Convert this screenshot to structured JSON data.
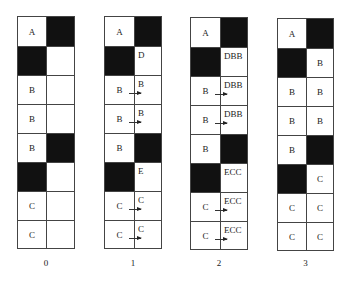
{
  "diagram": {
    "colors": {
      "filled": "#111111",
      "empty": "#ffffff",
      "line": "#444444"
    },
    "columns": [
      {
        "label": "0",
        "rows": [
          {
            "left": {
              "fill": false,
              "text": "A"
            },
            "right": {
              "fill": true,
              "text": ""
            },
            "arrow": false
          },
          {
            "left": {
              "fill": true,
              "text": ""
            },
            "right": {
              "fill": false,
              "text": ""
            },
            "arrow": false
          },
          {
            "left": {
              "fill": false,
              "text": "B"
            },
            "right": {
              "fill": false,
              "text": ""
            },
            "arrow": false
          },
          {
            "left": {
              "fill": false,
              "text": "B"
            },
            "right": {
              "fill": false,
              "text": ""
            },
            "arrow": false
          },
          {
            "left": {
              "fill": false,
              "text": "B"
            },
            "right": {
              "fill": true,
              "text": ""
            },
            "arrow": false
          },
          {
            "left": {
              "fill": true,
              "text": ""
            },
            "right": {
              "fill": false,
              "text": ""
            },
            "arrow": false
          },
          {
            "left": {
              "fill": false,
              "text": "C"
            },
            "right": {
              "fill": false,
              "text": ""
            },
            "arrow": false
          },
          {
            "left": {
              "fill": false,
              "text": "C"
            },
            "right": {
              "fill": false,
              "text": ""
            },
            "arrow": false
          }
        ]
      },
      {
        "label": "1",
        "rows": [
          {
            "left": {
              "fill": false,
              "text": "A"
            },
            "right": {
              "fill": true,
              "text": ""
            },
            "arrow": false
          },
          {
            "left": {
              "fill": true,
              "text": ""
            },
            "right": {
              "fill": false,
              "text": "D"
            },
            "arrow": false
          },
          {
            "left": {
              "fill": false,
              "text": "B"
            },
            "right": {
              "fill": false,
              "text": "B"
            },
            "arrow": true
          },
          {
            "left": {
              "fill": false,
              "text": "B"
            },
            "right": {
              "fill": false,
              "text": "B"
            },
            "arrow": true
          },
          {
            "left": {
              "fill": false,
              "text": "B"
            },
            "right": {
              "fill": true,
              "text": ""
            },
            "arrow": false
          },
          {
            "left": {
              "fill": true,
              "text": ""
            },
            "right": {
              "fill": false,
              "text": "E"
            },
            "arrow": false
          },
          {
            "left": {
              "fill": false,
              "text": "C"
            },
            "right": {
              "fill": false,
              "text": "C"
            },
            "arrow": true
          },
          {
            "left": {
              "fill": false,
              "text": "C"
            },
            "right": {
              "fill": false,
              "text": "C"
            },
            "arrow": true
          }
        ]
      },
      {
        "label": "2",
        "rows": [
          {
            "left": {
              "fill": false,
              "text": "A"
            },
            "right": {
              "fill": true,
              "text": ""
            },
            "arrow": false
          },
          {
            "left": {
              "fill": true,
              "text": ""
            },
            "right": {
              "fill": false,
              "text": "DBB"
            },
            "arrow": false
          },
          {
            "left": {
              "fill": false,
              "text": "B"
            },
            "right": {
              "fill": false,
              "text": "DBB"
            },
            "arrow": true
          },
          {
            "left": {
              "fill": false,
              "text": "B"
            },
            "right": {
              "fill": false,
              "text": "DBB"
            },
            "arrow": true
          },
          {
            "left": {
              "fill": false,
              "text": "B"
            },
            "right": {
              "fill": true,
              "text": ""
            },
            "arrow": false
          },
          {
            "left": {
              "fill": true,
              "text": ""
            },
            "right": {
              "fill": false,
              "text": "ECC"
            },
            "arrow": false
          },
          {
            "left": {
              "fill": false,
              "text": "C"
            },
            "right": {
              "fill": false,
              "text": "ECC"
            },
            "arrow": true
          },
          {
            "left": {
              "fill": false,
              "text": "C"
            },
            "right": {
              "fill": false,
              "text": "ECC"
            },
            "arrow": true
          }
        ]
      },
      {
        "label": "3",
        "rows": [
          {
            "left": {
              "fill": false,
              "text": "A"
            },
            "right": {
              "fill": true,
              "text": ""
            },
            "arrow": false
          },
          {
            "left": {
              "fill": true,
              "text": ""
            },
            "right": {
              "fill": false,
              "text": "B"
            },
            "arrow": false
          },
          {
            "left": {
              "fill": false,
              "text": "B"
            },
            "right": {
              "fill": false,
              "text": "B"
            },
            "arrow": false
          },
          {
            "left": {
              "fill": false,
              "text": "B"
            },
            "right": {
              "fill": false,
              "text": "B"
            },
            "arrow": false
          },
          {
            "left": {
              "fill": false,
              "text": "B"
            },
            "right": {
              "fill": true,
              "text": ""
            },
            "arrow": false
          },
          {
            "left": {
              "fill": true,
              "text": ""
            },
            "right": {
              "fill": false,
              "text": "C"
            },
            "arrow": false
          },
          {
            "left": {
              "fill": false,
              "text": "C"
            },
            "right": {
              "fill": false,
              "text": "C"
            },
            "arrow": false
          },
          {
            "left": {
              "fill": false,
              "text": "C"
            },
            "right": {
              "fill": false,
              "text": "C"
            },
            "arrow": false
          }
        ]
      }
    ]
  }
}
